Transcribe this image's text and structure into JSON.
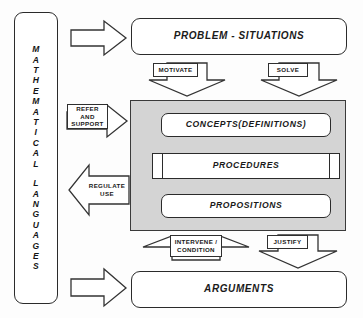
{
  "diagram": {
    "colors": {
      "core_panel_fill": "#d4d4d4",
      "box_fill": "#ffffff",
      "stroke": "#2b2b2b",
      "background": "#fdfdfd"
    }
  },
  "side_panel": {
    "name": "mathematical-languages",
    "line1": "MATHEMATICAL",
    "line2": "LANGUAGES",
    "letters1": [
      "M",
      "A",
      "T",
      "H",
      "E",
      "M",
      "A",
      "T",
      "I",
      "C",
      "A",
      "L"
    ],
    "letters2": [
      "L",
      "A",
      "N",
      "G",
      "U",
      "A",
      "G",
      "E",
      "S"
    ]
  },
  "nodes": {
    "problem_situations": "PROBLEM - SITUATIONS",
    "concepts": "CONCEPTS(DEFINITIONS)",
    "procedures": "PROCEDURES",
    "propositions": "PROPOSITIONS",
    "arguments": "ARGUMENTS"
  },
  "arrows": {
    "refer_support": {
      "line1": "REFER",
      "line2": "AND",
      "line3": "SUPPORT",
      "direction": "right"
    },
    "regulate_use": {
      "line1": "REGULATE",
      "line2": "USE",
      "direction": "left"
    },
    "motivate": {
      "label": "MOTIVATE",
      "direction": "down"
    },
    "solve": {
      "label": "SOLVE",
      "direction": "down"
    },
    "intervene_condition": {
      "line1": "INTERVENE /",
      "line2": "CONDITION",
      "direction": "up"
    },
    "justify": {
      "label": "JUSTIFY",
      "direction": "down"
    },
    "to_problem": {
      "label": "",
      "direction": "right"
    },
    "to_arguments": {
      "label": "",
      "direction": "right"
    }
  }
}
